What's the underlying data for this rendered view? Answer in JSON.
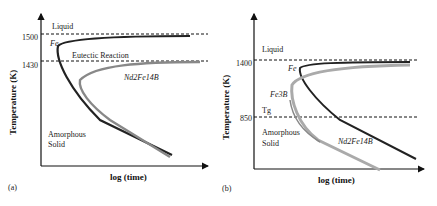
{
  "panels": [
    {
      "id": "a",
      "caption": "(a)",
      "ylabel": "Temperature (K)",
      "xlabel": "log (time)",
      "ticks": [
        "1500",
        "1430"
      ],
      "region_top": "Liquid",
      "region_bottom_1": "Amorphous",
      "region_bottom_2": "Solid",
      "line_label": "Eutectic Reaction",
      "curve_labels": [
        "Fe",
        "Nd2Fe14B"
      ]
    },
    {
      "id": "b",
      "caption": "(b)",
      "ylabel": "Temperature (K)",
      "xlabel": "log (time)",
      "ticks": [
        "1400",
        "850"
      ],
      "region_top": "Liquid",
      "region_bottom_1": "Amorphous",
      "region_bottom_2": "Solid",
      "line_label": "Tg",
      "curve_labels": [
        "Fe",
        "Fe3B",
        "Nd2Fe14B"
      ]
    }
  ],
  "colors": {
    "fe_curve": "#222222",
    "phase_curve": "#888888",
    "axis": "#111111"
  }
}
